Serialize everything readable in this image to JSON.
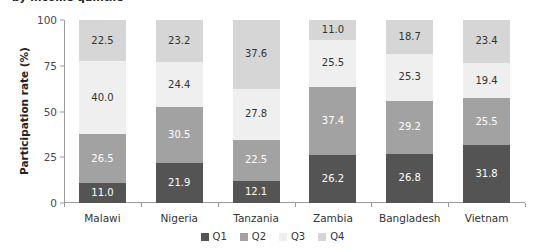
{
  "chart_data": {
    "type": "bar",
    "subtype": "stacked-vertical-100",
    "title": "by income quintile",
    "xlabel": "",
    "ylabel": "Participation rate (%)",
    "ylim": [
      0,
      100
    ],
    "yticks": [
      0,
      25,
      50,
      75,
      100
    ],
    "ytick_labels": [
      "0",
      "25",
      "50",
      "75",
      "100"
    ],
    "grid": false,
    "legend_position": "bottom",
    "categories": [
      "Malawi",
      "Nigeria",
      "Tanzania",
      "Zambia",
      "Bangladesh",
      "Vietnam"
    ],
    "series": [
      {
        "name": "Q1",
        "color": "#545454",
        "label_color": "#ffffff",
        "values": [
          11.0,
          21.9,
          12.1,
          26.2,
          26.8,
          31.8
        ]
      },
      {
        "name": "Q2",
        "color": "#a2a2a2",
        "label_color": "#ffffff",
        "values": [
          26.5,
          30.5,
          22.5,
          37.4,
          29.2,
          25.5
        ]
      },
      {
        "name": "Q3",
        "color": "#efefef",
        "label_color": "#333333",
        "values": [
          40.0,
          24.4,
          27.8,
          25.5,
          25.3,
          19.4
        ]
      },
      {
        "name": "Q4",
        "color": "#d6d6d6",
        "label_color": "#333333",
        "values": [
          22.5,
          23.2,
          37.6,
          11.0,
          18.7,
          23.4
        ]
      }
    ],
    "value_labels": {
      "Malawi": {
        "Q1": "11.0",
        "Q2": "26.5",
        "Q3": "40.0",
        "Q4": "22.5"
      },
      "Nigeria": {
        "Q1": "21.9",
        "Q2": "30.5",
        "Q3": "24.4",
        "Q4": "23.2"
      },
      "Tanzania": {
        "Q1": "12.1",
        "Q2": "22.5",
        "Q3": "27.8",
        "Q4": "37.6"
      },
      "Zambia": {
        "Q1": "26.2",
        "Q2": "37.4",
        "Q3": "25.5",
        "Q4": "11.0"
      },
      "Bangladesh": {
        "Q1": "26.8",
        "Q2": "29.2",
        "Q3": "25.3",
        "Q4": "18.7"
      },
      "Vietnam": {
        "Q1": "31.8",
        "Q2": "25.5",
        "Q3": "19.4",
        "Q4": "23.4"
      }
    },
    "legend": [
      {
        "label": "Q1",
        "color": "#545454"
      },
      {
        "label": "Q2",
        "color": "#a2a2a2"
      },
      {
        "label": "Q3",
        "color": "#efefef"
      },
      {
        "label": "Q4",
        "color": "#d6d6d6"
      }
    ]
  }
}
